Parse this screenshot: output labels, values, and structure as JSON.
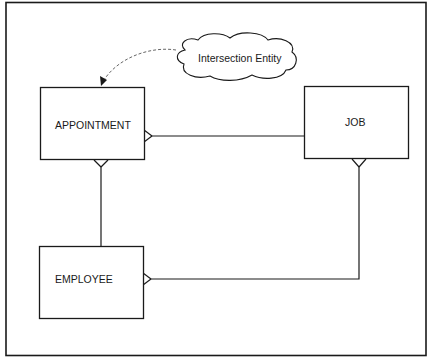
{
  "diagram": {
    "type": "entity-relationship",
    "frame": {
      "x": 6,
      "y": 2,
      "width": 420,
      "height": 353
    },
    "entities": [
      {
        "id": "appointment",
        "label": "APPOINTMENT",
        "x": 40,
        "y": 87,
        "width": 104,
        "height": 73
      },
      {
        "id": "job",
        "label": "JOB",
        "x": 304,
        "y": 86,
        "width": 104,
        "height": 73
      },
      {
        "id": "employee",
        "label": "EMPLOYEE",
        "x": 39,
        "y": 246,
        "width": 104,
        "height": 73
      }
    ],
    "relationships": [
      {
        "from": "job",
        "to": "appointment",
        "cardinality_end": "many",
        "crowfoot_at": "appointment"
      },
      {
        "from": "employee",
        "to": "appointment",
        "cardinality_end": "many",
        "crowfoot_at": "appointment"
      },
      {
        "from": "employee",
        "to": "job",
        "cardinality_end": "many",
        "crowfoot_at": "both"
      }
    ],
    "annotation": {
      "label": "Intersection Entity",
      "shape": "cloud",
      "points_to": "appointment",
      "arrow_style": "dashed"
    },
    "colors": {
      "line": "#1a1a1a",
      "background": "#ffffff",
      "dashed": "#555555"
    }
  }
}
